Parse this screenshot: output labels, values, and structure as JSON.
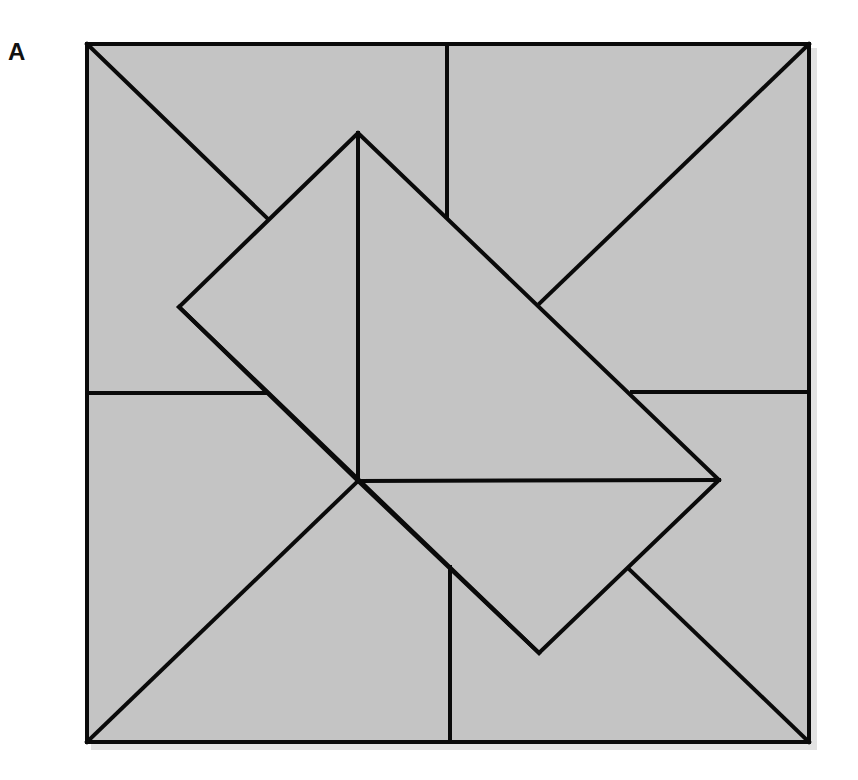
{
  "figure": {
    "panel_label": "A",
    "colors": {
      "fill": "#c4c4c4",
      "stroke": "#0a0a0a",
      "shadow": "#e2e2e2",
      "background": "#ffffff"
    },
    "stroke_width": 4,
    "outer_square": {
      "x1": 87,
      "y1": 44,
      "x2": 809,
      "y2": 742
    },
    "inner_square_vertices": [
      {
        "name": "top",
        "x": 358,
        "y": 133
      },
      {
        "name": "right",
        "x": 719,
        "y": 480
      },
      {
        "name": "bottom",
        "x": 539,
        "y": 653
      },
      {
        "name": "left",
        "x": 179,
        "y": 307
      }
    ],
    "center_point": {
      "x": 358,
      "y": 481
    },
    "segments": [
      {
        "name": "outer-diag-top-left",
        "x1": 87,
        "y1": 44,
        "x2": 267,
        "y2": 218
      },
      {
        "name": "outer-diag-top-right",
        "x1": 809,
        "y1": 44,
        "x2": 540,
        "y2": 303
      },
      {
        "name": "outer-diag-bottom-left",
        "x1": 87,
        "y1": 742,
        "x2": 358,
        "y2": 481
      },
      {
        "name": "outer-diag-bottom-right",
        "x1": 809,
        "y1": 742,
        "x2": 630,
        "y2": 570
      },
      {
        "name": "top-vertical",
        "x1": 447,
        "y1": 44,
        "x2": 447,
        "y2": 216
      },
      {
        "name": "bottom-vertical",
        "x1": 450,
        "y1": 567,
        "x2": 450,
        "y2": 742
      },
      {
        "name": "left-horizontal",
        "x1": 87,
        "y1": 393,
        "x2": 266,
        "y2": 393
      },
      {
        "name": "right-horizontal",
        "x1": 632,
        "y1": 392,
        "x2": 809,
        "y2": 392
      },
      {
        "name": "inner-vertical",
        "x1": 358,
        "y1": 133,
        "x2": 358,
        "y2": 481
      },
      {
        "name": "inner-horizontal",
        "x1": 358,
        "y1": 481,
        "x2": 719,
        "y2": 480
      },
      {
        "name": "inner-diag-left-to-center",
        "x1": 179,
        "y1": 307,
        "x2": 358,
        "y2": 481
      },
      {
        "name": "inner-diag-center-to-bottom",
        "x1": 358,
        "y1": 481,
        "x2": 539,
        "y2": 653
      }
    ]
  }
}
